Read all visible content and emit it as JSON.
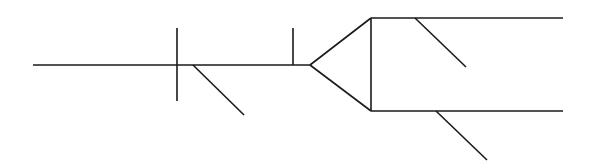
{
  "diagram": {
    "type": "syntax-tree-line-diagram",
    "background": "#ffffff",
    "stroke_color": "#1a1a1a",
    "stroke_width": 1.6,
    "width": 590,
    "height": 168,
    "lines": [
      {
        "name": "main-baseline",
        "x1": 33,
        "y1": 65,
        "x2": 310,
        "y2": 65
      },
      {
        "name": "subject-predicate-divider",
        "x1": 177,
        "y1": 28,
        "x2": 177,
        "y2": 101
      },
      {
        "name": "subject-modifier-diagonal",
        "x1": 193,
        "y1": 65,
        "x2": 244,
        "y2": 115
      },
      {
        "name": "object-divider",
        "x1": 293,
        "y1": 28,
        "x2": 293,
        "y2": 65
      },
      {
        "name": "fork-upper-arm",
        "x1": 310,
        "y1": 65,
        "x2": 371,
        "y2": 18
      },
      {
        "name": "fork-lower-arm",
        "x1": 310,
        "y1": 65,
        "x2": 371,
        "y2": 111
      },
      {
        "name": "fork-conjunction-line",
        "x1": 371,
        "y1": 18,
        "x2": 371,
        "y2": 111
      },
      {
        "name": "upper-branch-baseline",
        "x1": 371,
        "y1": 18,
        "x2": 563,
        "y2": 18
      },
      {
        "name": "upper-branch-modifier-diagonal",
        "x1": 415,
        "y1": 18,
        "x2": 466,
        "y2": 67
      },
      {
        "name": "lower-branch-baseline",
        "x1": 371,
        "y1": 111,
        "x2": 563,
        "y2": 111
      },
      {
        "name": "lower-branch-modifier-diagonal",
        "x1": 436,
        "y1": 111,
        "x2": 487,
        "y2": 160
      }
    ]
  }
}
